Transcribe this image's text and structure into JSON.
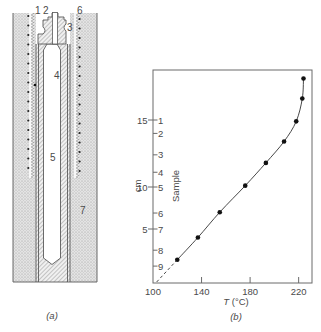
{
  "panel_a": {
    "caption": "(a)",
    "labels": [
      "1",
      "2",
      "3",
      "4",
      "5",
      "6",
      "7"
    ]
  },
  "panel_b": {
    "caption": "(b)"
  },
  "colors": {
    "line": "#555555",
    "text": "#4a4a4a",
    "marker": "#111111",
    "stipple": "#e3e3e3"
  },
  "chart_data": {
    "type": "line",
    "title": "",
    "panel_label": "(b)",
    "xlabel": "T (°C)",
    "xlabel_parts": {
      "symbol": "T",
      "unit": " (°C)"
    },
    "ylabel": "cm",
    "ylabel_secondary": "Sample",
    "xlim": [
      100,
      231
    ],
    "ylim": [
      0,
      18.7
    ],
    "xticks": [
      100,
      140,
      180,
      220
    ],
    "yticks": [
      5,
      10,
      15
    ],
    "grid": false,
    "legend": null,
    "sample_markers": [
      {
        "label": "1",
        "cm": 15.0
      },
      {
        "label": "2",
        "cm": 14.0
      },
      {
        "label": "3",
        "cm": 12.4
      },
      {
        "label": "4",
        "cm": 11.1
      },
      {
        "label": "5",
        "cm": 10.0
      },
      {
        "label": "6",
        "cm": 6.9
      },
      {
        "label": "7",
        "cm": 5.0
      },
      {
        "label": "8",
        "cm": 3.0
      },
      {
        "label": "9",
        "cm": 1.5
      }
    ],
    "series": [
      {
        "name": "Temperature profile",
        "x": [
          120,
          137,
          155,
          176,
          193,
          208,
          218,
          223,
          224
        ],
        "y": [
          2.1,
          4.2,
          7.0,
          10.1,
          11.8,
          13.4,
          14.9,
          16.6,
          18.1
        ],
        "marker": "filled-circle",
        "line": "solid"
      }
    ],
    "extrapolation": {
      "style": "dashed",
      "from": {
        "x": 103,
        "y": 0
      },
      "to": {
        "x": 120,
        "y": 2.1
      }
    }
  }
}
